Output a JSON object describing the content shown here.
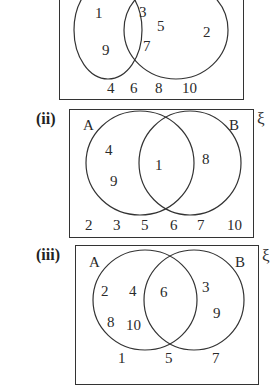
{
  "diagrams": [
    {
      "label": "",
      "set_a_label": "",
      "set_b_label": "",
      "universal_symbol": "",
      "only_a": [
        "1",
        "9"
      ],
      "intersection": [
        "3",
        "5",
        "7"
      ],
      "only_b": [
        "2"
      ],
      "outside": [
        "4",
        "6",
        "8",
        "10"
      ]
    },
    {
      "label": "(ii)",
      "set_a_label": "A",
      "set_b_label": "B",
      "universal_symbol": "ξ",
      "only_a": [
        "4",
        "9"
      ],
      "intersection": [
        "1"
      ],
      "only_b": [
        "8"
      ],
      "outside": [
        "2",
        "3",
        "5",
        "6",
        "7",
        "10"
      ]
    },
    {
      "label": "(iii)",
      "set_a_label": "A",
      "set_b_label": "B",
      "universal_symbol": "ξ",
      "only_a": [
        "2",
        "4",
        "8",
        "10"
      ],
      "intersection": [
        "6"
      ],
      "only_b": [
        "3",
        "9"
      ],
      "outside": [
        "1",
        "5",
        "7"
      ]
    }
  ]
}
